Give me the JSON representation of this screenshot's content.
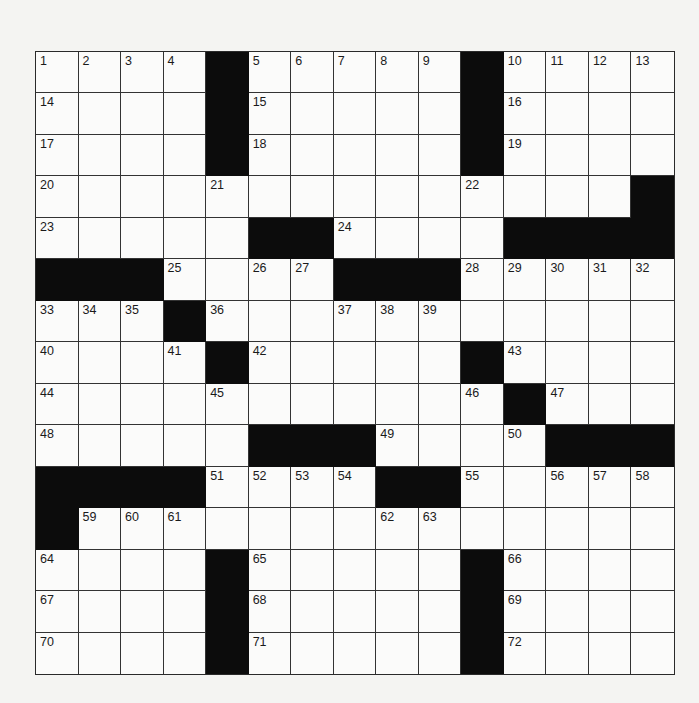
{
  "puzzle": {
    "rows": 15,
    "cols": 15,
    "colors": {
      "black_square": "#0c0c0c",
      "white_square": "#fbfbfa",
      "grid_line": "#333333",
      "number_text": "#1a1a1a"
    },
    "grid": [
      [
        "1",
        "2",
        "3",
        "4",
        "#",
        "5",
        "6",
        "7",
        "8",
        "9",
        "#",
        "10",
        "11",
        "12",
        "13"
      ],
      [
        "14",
        "",
        "",
        "",
        "#",
        "15",
        "",
        "",
        "",
        "",
        "#",
        "16",
        "",
        "",
        ""
      ],
      [
        "17",
        "",
        "",
        "",
        "#",
        "18",
        "",
        "",
        "",
        "",
        "#",
        "19",
        "",
        "",
        ""
      ],
      [
        "20",
        "",
        "",
        "",
        "21",
        "",
        "",
        "",
        "",
        "",
        "22",
        "",
        "",
        "",
        "#"
      ],
      [
        "23",
        "",
        "",
        "",
        "",
        "#",
        "#",
        "24",
        "",
        "",
        "",
        "#",
        "#",
        "#",
        "#"
      ],
      [
        "#",
        "#",
        "#",
        "25",
        "",
        "26",
        "27",
        "#",
        "#",
        "#",
        "28",
        "29",
        "30",
        "31",
        "32"
      ],
      [
        "33",
        "34",
        "35",
        "#",
        "36",
        "",
        "",
        "37",
        "38",
        "39",
        "",
        "",
        "",
        "",
        ""
      ],
      [
        "40",
        "",
        "",
        "41",
        "#",
        "42",
        "",
        "",
        "",
        "",
        "#",
        "43",
        "",
        "",
        ""
      ],
      [
        "44",
        "",
        "",
        "",
        "45",
        "",
        "",
        "",
        "",
        "",
        "46",
        "#",
        "47",
        "",
        ""
      ],
      [
        "48",
        "",
        "",
        "",
        "",
        "#",
        "#",
        "#",
        "49",
        "",
        "",
        "50",
        "#",
        "#",
        "#"
      ],
      [
        "#",
        "#",
        "#",
        "#",
        "51",
        "52",
        "53",
        "54",
        "#",
        "#",
        "55",
        "",
        "56",
        "57",
        "58"
      ],
      [
        "#",
        "59",
        "60",
        "61",
        "",
        "",
        "",
        "",
        "62",
        "63",
        "",
        "",
        "",
        "",
        ""
      ],
      [
        "64",
        "",
        "",
        "",
        "#",
        "65",
        "",
        "",
        "",
        "",
        "#",
        "66",
        "",
        "",
        ""
      ],
      [
        "67",
        "",
        "",
        "",
        "#",
        "68",
        "",
        "",
        "",
        "",
        "#",
        "69",
        "",
        "",
        ""
      ],
      [
        "70",
        "",
        "",
        "",
        "#",
        "71",
        "",
        "",
        "",
        "",
        "#",
        "72",
        "",
        "",
        ""
      ]
    ]
  }
}
